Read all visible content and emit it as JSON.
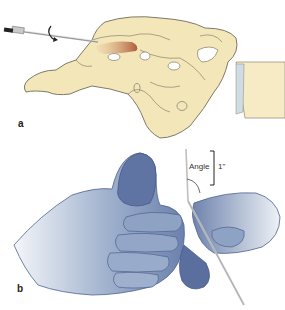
{
  "figure": {
    "panels": [
      {
        "id": "a",
        "label": "a",
        "description": "Sacrum/pelvis illustration with needle inserted via rotating drill into highlighted region",
        "colors": {
          "bone": "#f3e6b8",
          "bone_outline": "#8a8470",
          "highlight": "#b86a40",
          "cartilage": "#cdd9e3"
        }
      },
      {
        "id": "b",
        "label": "b",
        "description": "Hands gripping a needle/pin with angle annotation",
        "annotation": {
          "angle_label": "Angle",
          "measurement": "1\""
        },
        "colors": {
          "skin_dark": "#5d73a3",
          "skin_light": "#dfe6ee",
          "outline": "#4b5f87",
          "needle": "#c8c8c8"
        }
      }
    ]
  }
}
